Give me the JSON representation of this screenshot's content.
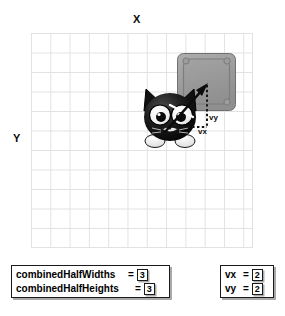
{
  "scene": {
    "axes": {
      "x_label": "X",
      "y_label": "Y"
    },
    "grid": {
      "columns": 11,
      "rows": 11,
      "line_color": "#e2e2e6",
      "background": "#ffffff"
    },
    "target_square": {
      "name": "target-square",
      "fill_color": "#9a9a9a",
      "border_color": "#6e6e6e"
    },
    "sprite": {
      "name": "cat-sprite",
      "body_color": "#111111",
      "eye_color": "#ffffff"
    },
    "vector": {
      "arrow_color": "#101010",
      "guide_style": "dotted",
      "label_vy": "vy",
      "label_vx": "vx"
    }
  },
  "readouts": {
    "combined": [
      {
        "name": "combinedHalfWidths",
        "eq": "=",
        "value": "3"
      },
      {
        "name": "combinedHalfHeights",
        "eq": "=",
        "value": "3"
      }
    ],
    "velocity": [
      {
        "name": "vx",
        "eq": "=",
        "value": "2"
      },
      {
        "name": "vy",
        "eq": "=",
        "value": "2"
      }
    ]
  }
}
